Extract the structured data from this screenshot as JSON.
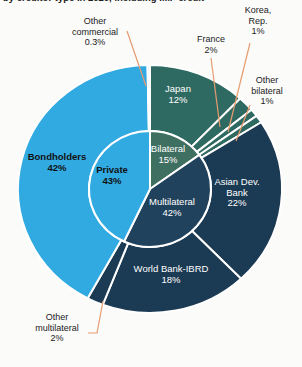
{
  "page": {
    "clipped_title": "by creditor type in 2020, including IMF credit"
  },
  "colors": {
    "background": "#fbfbfa",
    "segment_border": "#ffffff",
    "leader_line": "#e89b6f",
    "light_blue": "#31aae1",
    "teal": "#2f6a62",
    "inner_green": "#3f6f61",
    "navy": "#1b3a53",
    "inner_navy": "#21425c",
    "pale_sliver": "#e2f1fa"
  },
  "chart_data": {
    "type": "pie",
    "subtype": "nested-donut",
    "legend_position": "none (direct labels on and around slices)",
    "inner_series": {
      "name": "creditor-category",
      "start_angle_deg": 0,
      "direction": "clockwise",
      "slices": [
        {
          "id": "bilateral",
          "label": "Bilateral",
          "label_lines": [
            "Bilateral"
          ],
          "pct": "15%",
          "value": 15,
          "color": "#3f6f61",
          "text_color": "#ffffff"
        },
        {
          "id": "multilateral",
          "label": "Multilateral",
          "label_lines": [
            "Multilateral"
          ],
          "pct": "42%",
          "value": 42,
          "color": "#21425c",
          "text_color": "#ffffff"
        },
        {
          "id": "private",
          "label": "Private",
          "label_lines": [
            "Private"
          ],
          "pct": "43%",
          "value": 43,
          "color": "#31aae1",
          "text_color": "#111111"
        }
      ]
    },
    "outer_series": {
      "name": "creditor-detail",
      "start_angle_deg": 0,
      "direction": "clockwise",
      "slices": [
        {
          "id": "japan",
          "label": "Japan",
          "label_lines": [
            "Japan"
          ],
          "pct": "12%",
          "value": 12,
          "color": "#2f6a62",
          "text_color": "#ffffff",
          "label_placement": "inside"
        },
        {
          "id": "france",
          "label": "France",
          "label_lines": [
            "France"
          ],
          "pct": "2%",
          "value": 2,
          "color": "#2f6a62",
          "label_placement": "outside-callout"
        },
        {
          "id": "korea",
          "label": "Korea, Rep.",
          "label_lines": [
            "Korea,",
            "Rep."
          ],
          "pct": "1%",
          "value": 1,
          "color": "#2f6a62",
          "label_placement": "outside-callout"
        },
        {
          "id": "other_bilateral",
          "label": "Other bilateral",
          "label_lines": [
            "Other",
            "bilateral"
          ],
          "pct": "1%",
          "value": 1,
          "color": "#2f6a62",
          "label_placement": "outside-callout"
        },
        {
          "id": "adb",
          "label": "Asian Dev. Bank",
          "label_lines": [
            "Asian Dev.",
            "Bank"
          ],
          "pct": "22%",
          "value": 22,
          "color": "#1b3a53",
          "text_color": "#ffffff",
          "label_placement": "inside"
        },
        {
          "id": "wb",
          "label": "World Bank-IBRD",
          "label_lines": [
            "World Bank-IBRD"
          ],
          "pct": "18%",
          "value": 18,
          "color": "#1b3a53",
          "text_color": "#ffffff",
          "label_placement": "inside"
        },
        {
          "id": "other_multilateral",
          "label": "Other multilateral",
          "label_lines": [
            "Other",
            "multilateral"
          ],
          "pct": "2%",
          "value": 2,
          "color": "#1b3a53",
          "label_placement": "outside-callout"
        },
        {
          "id": "bondholders",
          "label": "Bondholders",
          "label_lines": [
            "Bondholders"
          ],
          "pct": "42%",
          "value": 42,
          "color": "#31aae1",
          "text_color": "#111111",
          "label_placement": "inside"
        },
        {
          "id": "other_commercial",
          "label": "Other commercial",
          "label_lines": [
            "Other",
            "commercial"
          ],
          "pct": "0.3%",
          "value": 0.3,
          "color": "#e2f1fa",
          "label_placement": "outside-callout"
        }
      ]
    }
  }
}
